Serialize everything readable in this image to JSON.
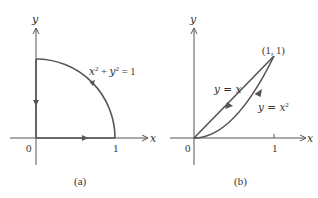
{
  "figure": {
    "panels": [
      {
        "id": "a",
        "caption": "(a)",
        "x_axis_label": "x",
        "y_axis_label": "y",
        "origin_label": "0",
        "x_tick_label": "1",
        "curve_label": {
          "base1": "x",
          "exp1": "2",
          "plus": " + ",
          "base2": "y",
          "exp2": "2",
          "rhs": " = 1"
        },
        "path_description": "Closed path: along x-axis from 0 to 1, counterclockwise along quarter circle x^2 + y^2 = 1 to (0,1), then down the y-axis to 0"
      },
      {
        "id": "b",
        "caption": "(b)",
        "x_axis_label": "x",
        "y_axis_label": "y",
        "origin_label": "0",
        "x_tick_label": "1",
        "point_label": "(1, 1)",
        "line_label": "y = x",
        "parabola_label": {
          "base": "y = x",
          "exp": "2"
        },
        "path_description": "Closed path: along y = x^2 from (0,0) to (1,1), then back along y = x to (0,0)"
      }
    ]
  }
}
